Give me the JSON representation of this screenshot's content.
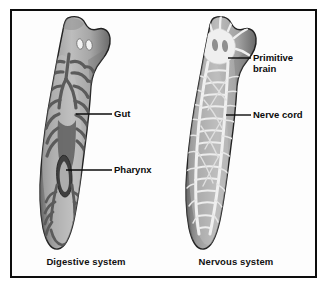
{
  "figure": {
    "name": "planarian-anatomy-figure",
    "background_color": "#ffffff",
    "frame_color": "#0d0d0d",
    "label_color": "#0b0b0b"
  },
  "panels": [
    {
      "id": "digestive",
      "caption": "Digestive system",
      "organism": "planarian-flatworm",
      "features": [
        "eyespots",
        "branching gut",
        "pharynx"
      ]
    },
    {
      "id": "nervous",
      "caption": "Nervous system",
      "organism": "planarian-flatworm",
      "features": [
        "primitive brain",
        "ladder-like nerve cords",
        "transverse commissures"
      ]
    }
  ],
  "callouts": {
    "gut": "Gut",
    "pharynx": "Pharynx",
    "primitive_brain": "Primitive\nbrain",
    "nerve_cord": "Nerve cord"
  },
  "captions": {
    "digestive": "Digestive system",
    "nervous": "Nervous system"
  },
  "colors": {
    "body_light": "#c9c9c9",
    "body_mid": "#9a9a9a",
    "body_dark": "#6b6b6b",
    "outline": "#2a2a2a",
    "gut_dark": "#5d5d5d",
    "nerve_white": "#f2f2f2",
    "eyespot": "#f4f4f4"
  }
}
